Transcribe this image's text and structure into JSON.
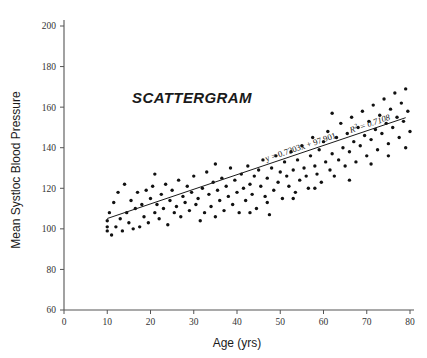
{
  "chart_data": {
    "type": "scatter",
    "title": "SCATTERGRAM",
    "xlabel": "Age (yrs)",
    "ylabel": "Mean Systloc Blood Pressure",
    "xlim": [
      0,
      80
    ],
    "ylim": [
      60,
      200
    ],
    "xticks": [
      0,
      10,
      20,
      30,
      40,
      50,
      60,
      70,
      80
    ],
    "yticks": [
      60,
      80,
      100,
      120,
      140,
      160,
      180,
      200
    ],
    "grid": false,
    "legend": false,
    "point_color": "#111111",
    "line_color": "#1a1a1a",
    "axis_color": "#555555",
    "regression": {
      "equation_label": "y = 0.7203x + 97.901",
      "r2_label": "R² = 0.7108",
      "slope": 0.7203,
      "intercept": 97.901,
      "r_squared": 0.7108,
      "x_start": 10,
      "x_end": 79
    },
    "points": [
      [
        10,
        99
      ],
      [
        10,
        101
      ],
      [
        10,
        104
      ],
      [
        10.5,
        108
      ],
      [
        11,
        97
      ],
      [
        11.5,
        113
      ],
      [
        12,
        101
      ],
      [
        13,
        105
      ],
      [
        13.5,
        99
      ],
      [
        14,
        122
      ],
      [
        14.5,
        108
      ],
      [
        15,
        103
      ],
      [
        15.5,
        114
      ],
      [
        16,
        100
      ],
      [
        16.5,
        110
      ],
      [
        17,
        118
      ],
      [
        17.5,
        101
      ],
      [
        18,
        112
      ],
      [
        18.5,
        106
      ],
      [
        19,
        119
      ],
      [
        19.5,
        103
      ],
      [
        20,
        115
      ],
      [
        20.5,
        121
      ],
      [
        21,
        108
      ],
      [
        21.5,
        112
      ],
      [
        22,
        105
      ],
      [
        22.5,
        117
      ],
      [
        23,
        110
      ],
      [
        23.5,
        122
      ],
      [
        24,
        102
      ],
      [
        24.5,
        114
      ],
      [
        25,
        119
      ],
      [
        25.5,
        108
      ],
      [
        26,
        111
      ],
      [
        26.5,
        124
      ],
      [
        27,
        106
      ],
      [
        27.5,
        116
      ],
      [
        28,
        113
      ],
      [
        28.5,
        121
      ],
      [
        29,
        109
      ],
      [
        29.5,
        118
      ],
      [
        30,
        126
      ],
      [
        30.5,
        112
      ],
      [
        31,
        115
      ],
      [
        31.5,
        104
      ],
      [
        32,
        120
      ],
      [
        32.5,
        108
      ],
      [
        33,
        128
      ],
      [
        33.5,
        117
      ],
      [
        34,
        111
      ],
      [
        34.5,
        123
      ],
      [
        35,
        106
      ],
      [
        35.5,
        119
      ],
      [
        36,
        114
      ],
      [
        36.5,
        125
      ],
      [
        37,
        109
      ],
      [
        37.5,
        121
      ],
      [
        38,
        116
      ],
      [
        38.5,
        130
      ],
      [
        39,
        112
      ],
      [
        39.5,
        124
      ],
      [
        40,
        118
      ],
      [
        40.5,
        108
      ],
      [
        41,
        127
      ],
      [
        41.5,
        120
      ],
      [
        42,
        114
      ],
      [
        42.5,
        131
      ],
      [
        43,
        122
      ],
      [
        43.5,
        117
      ],
      [
        44,
        126
      ],
      [
        44.5,
        110
      ],
      [
        45,
        129
      ],
      [
        45.5,
        121
      ],
      [
        46,
        134
      ],
      [
        46.5,
        116
      ],
      [
        47,
        125
      ],
      [
        47.5,
        107
      ],
      [
        48,
        130
      ],
      [
        48.5,
        119
      ],
      [
        49,
        136
      ],
      [
        49.5,
        123
      ],
      [
        50,
        128
      ],
      [
        50.5,
        115
      ],
      [
        51,
        133
      ],
      [
        51.5,
        126
      ],
      [
        52,
        121
      ],
      [
        52.5,
        138
      ],
      [
        53,
        129
      ],
      [
        53.5,
        118
      ],
      [
        54,
        134
      ],
      [
        54.5,
        124
      ],
      [
        55,
        141
      ],
      [
        55.5,
        130
      ],
      [
        56,
        126
      ],
      [
        56.5,
        120
      ],
      [
        57,
        136
      ],
      [
        57.5,
        145
      ],
      [
        58,
        131
      ],
      [
        58.5,
        127
      ],
      [
        59,
        139
      ],
      [
        59.5,
        123
      ],
      [
        60,
        143
      ],
      [
        60.5,
        133
      ],
      [
        61,
        148
      ],
      [
        61.5,
        129
      ],
      [
        62,
        137
      ],
      [
        62.5,
        126
      ],
      [
        63,
        145
      ],
      [
        63.5,
        134
      ],
      [
        64,
        152
      ],
      [
        64.5,
        140
      ],
      [
        65,
        131
      ],
      [
        65.5,
        147
      ],
      [
        66,
        138
      ],
      [
        66.5,
        155
      ],
      [
        67,
        143
      ],
      [
        67.5,
        133
      ],
      [
        68,
        150
      ],
      [
        68.5,
        141
      ],
      [
        69,
        158
      ],
      [
        69.5,
        146
      ],
      [
        70,
        136
      ],
      [
        70.5,
        153
      ],
      [
        71,
        144
      ],
      [
        71.5,
        161
      ],
      [
        72,
        149
      ],
      [
        72.5,
        139
      ],
      [
        73,
        156
      ],
      [
        73.5,
        147
      ],
      [
        74,
        164
      ],
      [
        74.5,
        152
      ],
      [
        75,
        142
      ],
      [
        75.5,
        159
      ],
      [
        76,
        150
      ],
      [
        76.5,
        167
      ],
      [
        77,
        155
      ],
      [
        77.5,
        145
      ],
      [
        78,
        162
      ],
      [
        78.5,
        153
      ],
      [
        79,
        169
      ],
      [
        79.5,
        158
      ],
      [
        80,
        148
      ],
      [
        12.5,
        118
      ],
      [
        21,
        127
      ],
      [
        35,
        132
      ],
      [
        43,
        108
      ],
      [
        47,
        113
      ],
      [
        53,
        115
      ],
      [
        58,
        120
      ],
      [
        62,
        157
      ],
      [
        66,
        124
      ],
      [
        71,
        132
      ],
      [
        75,
        136
      ],
      [
        79,
        140
      ]
    ]
  }
}
